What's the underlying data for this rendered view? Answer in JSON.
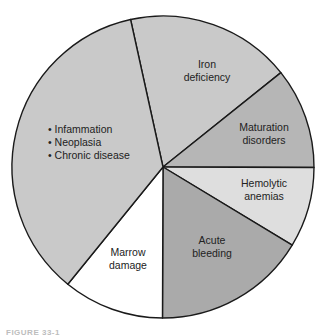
{
  "chart_data": {
    "type": "pie",
    "title": "",
    "center": [
      163,
      167
    ],
    "radius": 151,
    "start_angle_deg": -12.4,
    "categories": [
      "Iron deficiency",
      "Maturation disorders",
      "Hemolytic anemias",
      "Acute bleeding",
      "Marrow damage",
      "Inflammation / Neoplasia / Chronic disease"
    ],
    "values": [
      17.7,
      10.8,
      8.6,
      16.4,
      10.8,
      35.7
    ],
    "colors": [
      "#c9c9c9",
      "#b6b6b6",
      "#dedede",
      "#aaaaaa",
      "#ffffff",
      "#c9c9c9"
    ],
    "slices": [
      {
        "label_lines": [
          "Iron",
          "deficiency"
        ],
        "percent": 17.7,
        "label_pos": [
          207,
          68
        ],
        "anchor": "middle",
        "bullets": false
      },
      {
        "label_lines": [
          "Maturation",
          "disorders"
        ],
        "percent": 10.8,
        "label_pos": [
          264,
          131
        ],
        "anchor": "middle",
        "bullets": false
      },
      {
        "label_lines": [
          "Hemolytic",
          "anemias"
        ],
        "percent": 8.6,
        "label_pos": [
          264,
          187
        ],
        "anchor": "middle",
        "bullets": false
      },
      {
        "label_lines": [
          "Acute",
          "bleeding"
        ],
        "percent": 16.4,
        "label_pos": [
          212,
          244
        ],
        "anchor": "middle",
        "bullets": false
      },
      {
        "label_lines": [
          "Marrow",
          "damage"
        ],
        "percent": 10.8,
        "label_pos": [
          128,
          256
        ],
        "anchor": "middle",
        "bullets": false
      },
      {
        "label_lines": [
          "Infammation",
          "Neoplasia",
          "Chronic disease"
        ],
        "percent": 35.7,
        "label_pos": [
          48,
          133
        ],
        "anchor": "start",
        "bullets": true
      }
    ]
  },
  "caption": "FIGURE 33-1"
}
